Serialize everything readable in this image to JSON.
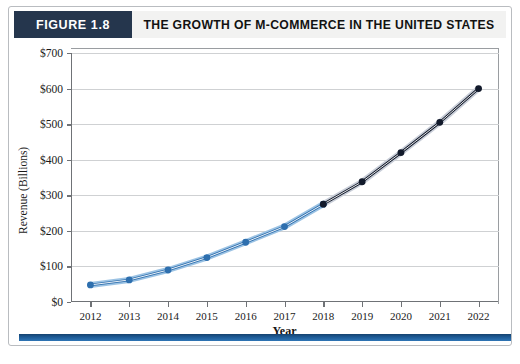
{
  "figure": {
    "tag": "FIGURE 1.8",
    "title": "THE GROWTH OF M-COMMERCE IN THE UNITED STATES"
  },
  "colors": {
    "tag_background": "#25364d",
    "title_background": "#f2f2f1",
    "series_early": "#2e6fae",
    "series_late": "#121a2b",
    "gridline": "#cfd1d3",
    "axis": "#6f7276",
    "bottom_rule": "#1d5b96"
  },
  "chart_data": {
    "type": "line",
    "title": "THE GROWTH OF M-COMMERCE IN THE UNITED STATES",
    "xlabel": "Year",
    "ylabel": "Revenue (Billions)",
    "x": [
      2012,
      2013,
      2014,
      2015,
      2016,
      2017,
      2018,
      2019,
      2020,
      2021,
      2022
    ],
    "categories": [
      "2012",
      "2013",
      "2014",
      "2015",
      "2016",
      "2017",
      "2018",
      "2019",
      "2020",
      "2021",
      "2022"
    ],
    "values": [
      48,
      62,
      90,
      125,
      168,
      212,
      275,
      338,
      420,
      505,
      600
    ],
    "series": [
      {
        "name": "Actual",
        "color": "#2e6fae",
        "x": [
          2012,
          2013,
          2014,
          2015,
          2016,
          2017,
          2018
        ],
        "values": [
          48,
          62,
          90,
          125,
          168,
          212,
          275
        ]
      },
      {
        "name": "Projected",
        "color": "#121a2b",
        "x": [
          2018,
          2019,
          2020,
          2021,
          2022
        ],
        "values": [
          275,
          338,
          420,
          505,
          600
        ]
      }
    ],
    "ylim": [
      0,
      700
    ],
    "ytick_values": [
      0,
      100,
      200,
      300,
      400,
      500,
      600,
      700
    ],
    "ytick_labels": [
      "$0",
      "$100",
      "$200",
      "$300",
      "$400",
      "$500",
      "$600",
      "$700"
    ],
    "xtick_labels": [
      "2012",
      "2013",
      "2014",
      "2015",
      "2016",
      "2017",
      "2018",
      "2019",
      "2020",
      "2021",
      "2022"
    ],
    "grid": true,
    "grid_axis": "y",
    "legend": false
  }
}
